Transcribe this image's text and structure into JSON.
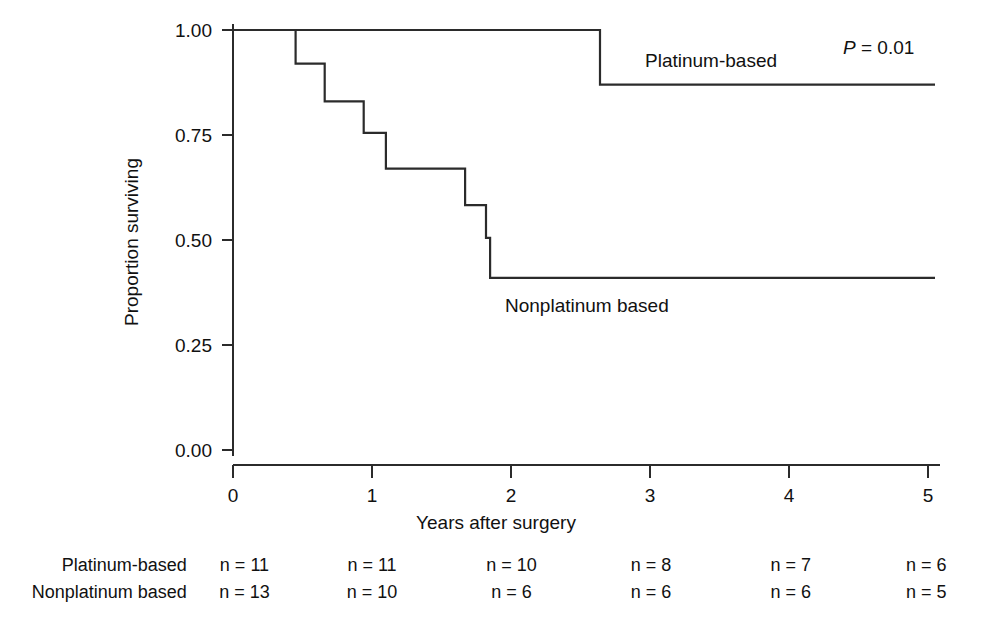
{
  "chart_data": {
    "type": "line",
    "subtype": "kaplan-meier-step",
    "title": "",
    "xlabel": "Years after surgery",
    "ylabel": "Proportion surviving",
    "xlim": [
      0,
      5
    ],
    "ylim": [
      0,
      1
    ],
    "xticks": [
      "0",
      "1",
      "2",
      "3",
      "4",
      "5"
    ],
    "xtick_values": [
      0,
      1,
      2,
      3,
      4,
      5
    ],
    "yticks": [
      "0.00",
      "0.25",
      "0.50",
      "0.75",
      "1.00"
    ],
    "ytick_values": [
      0,
      0.25,
      0.5,
      0.75,
      1
    ],
    "grid": false,
    "legend_position": "inline-annotation",
    "annotations": [
      {
        "name": "p-value",
        "text_prefix": "P",
        "text_suffix": " = 0.01",
        "x": 4.4,
        "y": 0.975
      },
      {
        "name": "platinum-curve-label",
        "text": "Platinum-based",
        "x": 2.97,
        "y": 0.93
      },
      {
        "name": "nonplatinum-curve-label",
        "text": "Nonplatinum based",
        "x": 2.05,
        "y": 0.345
      }
    ],
    "series": [
      {
        "name": "Platinum-based",
        "steps_x": [
          0.0,
          2.64,
          2.64,
          5.05
        ],
        "steps_y": [
          1.0,
          1.0,
          0.87,
          0.87
        ],
        "events": [
          {
            "time": 2.64,
            "from": 1.0,
            "to": 0.87
          }
        ],
        "final_survival": 0.87
      },
      {
        "name": "Nonplatinum based",
        "steps_x": [
          0.0,
          0.45,
          0.45,
          0.66,
          0.66,
          0.94,
          0.94,
          1.1,
          1.1,
          1.67,
          1.67,
          1.82,
          1.82,
          1.85,
          1.85,
          5.05
        ],
        "steps_y": [
          1.0,
          1.0,
          0.92,
          0.92,
          0.83,
          0.83,
          0.755,
          0.755,
          0.67,
          0.67,
          0.583,
          0.583,
          0.505,
          0.505,
          0.41,
          0.41
        ],
        "events": [
          {
            "time": 0.45,
            "from": 1.0,
            "to": 0.92
          },
          {
            "time": 0.66,
            "from": 0.92,
            "to": 0.83
          },
          {
            "time": 0.94,
            "from": 0.83,
            "to": 0.755
          },
          {
            "time": 1.1,
            "from": 0.755,
            "to": 0.67
          },
          {
            "time": 1.67,
            "from": 0.67,
            "to": 0.583
          },
          {
            "time": 1.82,
            "from": 0.583,
            "to": 0.505
          },
          {
            "time": 1.85,
            "from": 0.505,
            "to": 0.41
          }
        ],
        "final_survival": 0.41
      }
    ],
    "risk_table": {
      "time_points": [
        0,
        1,
        2,
        3,
        4,
        5
      ],
      "rows": [
        {
          "label": "Platinum-based",
          "counts": [
            "n = 11",
            "n = 11",
            "n = 10",
            "n = 8",
            "n = 7",
            "n = 6"
          ]
        },
        {
          "label": "Nonplatinum based",
          "counts": [
            "n = 13",
            "n = 10",
            "n = 6",
            "n = 6",
            "n = 6",
            "n = 5"
          ]
        }
      ]
    },
    "colors": {
      "line": "#2b2b2b",
      "axis": "#2b2b2b",
      "text": "#111111",
      "background": "#ffffff"
    }
  }
}
